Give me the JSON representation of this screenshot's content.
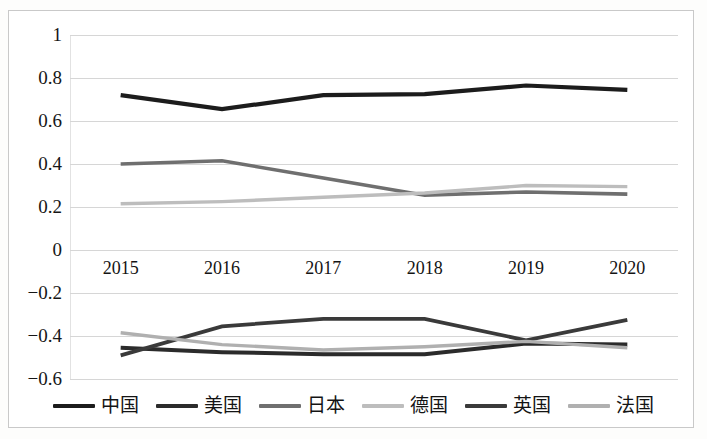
{
  "chart_data": {
    "type": "line",
    "title": "",
    "subtitle": "",
    "xlabel": "",
    "ylabel": "",
    "categories": [
      "2015",
      "2016",
      "2017",
      "2018",
      "2019",
      "2020"
    ],
    "x_tick_labels": [
      "2015",
      "2016",
      "2017",
      "2018",
      "2019",
      "2020"
    ],
    "y_tick_labels": [
      "1",
      "0.8",
      "0.6",
      "0.4",
      "0.2",
      "0",
      "−0.2",
      "−0.4",
      "−0.6"
    ],
    "y_tick_values": [
      1,
      0.8,
      0.6,
      0.4,
      0.2,
      0,
      -0.2,
      -0.4,
      -0.6
    ],
    "ylim": [
      -0.6,
      1
    ],
    "xlim": [
      0,
      5
    ],
    "grid": true,
    "grid_axis": "y",
    "legend_position": "bottom",
    "series": [
      {
        "name": "中国",
        "color": "#1c1c1c",
        "width": 4.2,
        "values": [
          0.72,
          0.655,
          0.72,
          0.725,
          0.765,
          0.745
        ]
      },
      {
        "name": "美国",
        "color": "#2b2b2b",
        "width": 4.0,
        "values": [
          -0.455,
          -0.475,
          -0.485,
          -0.485,
          -0.435,
          -0.44
        ]
      },
      {
        "name": "日本",
        "color": "#6f6f6f",
        "width": 3.6,
        "values": [
          0.4,
          0.415,
          0.335,
          0.255,
          0.27,
          0.26
        ]
      },
      {
        "name": "德国",
        "color": "#bdbdbd",
        "width": 3.4,
        "values": [
          0.215,
          0.225,
          0.245,
          0.265,
          0.3,
          0.295
        ]
      },
      {
        "name": "英国",
        "color": "#3a3a3a",
        "width": 3.8,
        "values": [
          -0.49,
          -0.355,
          -0.32,
          -0.32,
          -0.42,
          -0.325
        ]
      },
      {
        "name": "法国",
        "color": "#b0b0b0",
        "width": 3.4,
        "values": [
          -0.385,
          -0.44,
          -0.465,
          -0.45,
          -0.425,
          -0.455
        ]
      }
    ]
  },
  "legend": {
    "items": [
      {
        "label": "中国",
        "color": "#1c1c1c"
      },
      {
        "label": "美国",
        "color": "#2b2b2b"
      },
      {
        "label": "日本",
        "color": "#6f6f6f"
      },
      {
        "label": "德国",
        "color": "#bdbdbd"
      },
      {
        "label": "英国",
        "color": "#3a3a3a"
      },
      {
        "label": "法国",
        "color": "#b0b0b0"
      }
    ]
  },
  "colors": {
    "gridline": "#d6d6d6",
    "frame": "#c9c9c9",
    "background": "#ffffff",
    "text": "#141414"
  }
}
